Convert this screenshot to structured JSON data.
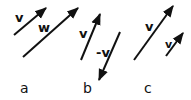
{
  "figures": [
    {
      "caption": "a",
      "vectors": [
        {
          "label": "v",
          "x1": 14,
          "y1": 35,
          "x2": 46,
          "y2": 8
        },
        {
          "label": "w",
          "x1": 23,
          "y1": 57,
          "x2": 78,
          "y2": 8
        }
      ]
    },
    {
      "caption": "b",
      "vectors": [
        {
          "label": "v",
          "x1": 81,
          "y1": 60,
          "x2": 100,
          "y2": 14
        },
        {
          "label": "-v",
          "x1": 120,
          "y1": 32,
          "x2": 99,
          "y2": 80
        }
      ]
    },
    {
      "caption": "c",
      "vectors": [
        {
          "label": "v",
          "x1": 134,
          "y1": 60,
          "x2": 173,
          "y2": 6
        },
        {
          "label": "v",
          "x1": 166,
          "y1": 56,
          "x2": 183,
          "y2": 33
        }
      ]
    }
  ],
  "colors": {
    "stroke": "#111111",
    "background": "#ffffff"
  }
}
